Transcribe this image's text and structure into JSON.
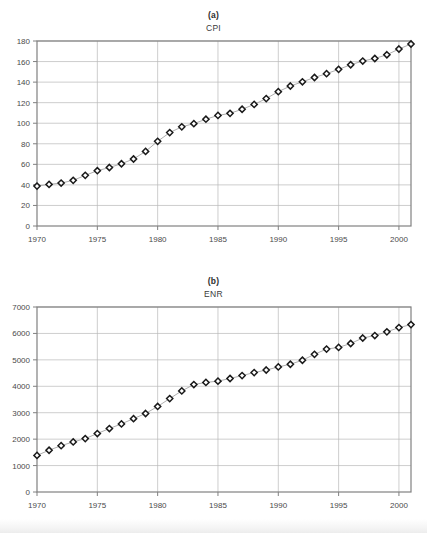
{
  "figure": {
    "panels": [
      {
        "letter": "(a)",
        "title": "CPI"
      },
      {
        "letter": "(b)",
        "title": "ENR"
      }
    ]
  },
  "colors": {
    "axis": "#808080",
    "gridline": "#b8b8b8",
    "marker_stroke": "#1a1a1a",
    "marker_fill": "#ffffff",
    "series_line": "#999999",
    "text": "#3a3a3a",
    "background": "#ffffff"
  },
  "chart_data": [
    {
      "type": "line",
      "title": "CPI",
      "panel_label": "(a)",
      "xlabel": "",
      "ylabel": "",
      "xlim": [
        1970,
        2001
      ],
      "ylim": [
        0,
        180
      ],
      "xticks": [
        1970,
        1975,
        1980,
        1985,
        1990,
        1995,
        2000
      ],
      "yticks": [
        0,
        20,
        40,
        60,
        80,
        100,
        120,
        140,
        160,
        180
      ],
      "xtick_labels": [
        "1970",
        "1975",
        "1980",
        "1985",
        "1990",
        "1995",
        "2000"
      ],
      "ytick_labels": [
        "0",
        "20",
        "40",
        "60",
        "80",
        "100",
        "120",
        "140",
        "160",
        "180"
      ],
      "grid": true,
      "legend": false,
      "marker": "open-diamond",
      "x": [
        1970,
        1971,
        1972,
        1973,
        1974,
        1975,
        1976,
        1977,
        1978,
        1979,
        1980,
        1981,
        1982,
        1983,
        1984,
        1985,
        1986,
        1987,
        1988,
        1989,
        1990,
        1991,
        1992,
        1993,
        1994,
        1995,
        1996,
        1997,
        1998,
        1999,
        2000,
        2001
      ],
      "values": [
        38.8,
        40.5,
        41.8,
        44.4,
        49.3,
        53.8,
        56.9,
        60.6,
        65.2,
        72.6,
        82.4,
        90.9,
        96.5,
        99.6,
        103.9,
        107.6,
        109.6,
        113.6,
        118.3,
        124.0,
        130.7,
        136.2,
        140.3,
        144.5,
        148.2,
        152.4,
        156.9,
        160.5,
        163.0,
        166.6,
        172.2,
        177.1
      ],
      "note": "Consumer Price Index, annual values 1970-2001"
    },
    {
      "type": "line",
      "title": "ENR",
      "panel_label": "(b)",
      "xlabel": "",
      "ylabel": "",
      "xlim": [
        1970,
        2001
      ],
      "ylim": [
        0,
        7000
      ],
      "xticks": [
        1970,
        1975,
        1980,
        1985,
        1990,
        1995,
        2000
      ],
      "yticks": [
        0,
        1000,
        2000,
        3000,
        4000,
        5000,
        6000,
        7000
      ],
      "xtick_labels": [
        "1970",
        "1975",
        "1980",
        "1985",
        "1990",
        "1995",
        "2000"
      ],
      "ytick_labels": [
        "0",
        "1000",
        "2000",
        "3000",
        "4000",
        "5000",
        "6000",
        "7000"
      ],
      "grid": true,
      "legend": false,
      "marker": "open-diamond",
      "x": [
        1970,
        1971,
        1972,
        1973,
        1974,
        1975,
        1976,
        1977,
        1978,
        1979,
        1980,
        1981,
        1982,
        1983,
        1984,
        1985,
        1986,
        1987,
        1988,
        1989,
        1990,
        1991,
        1992,
        1993,
        1994,
        1995,
        1996,
        1997,
        1998,
        1999,
        2000,
        2001
      ],
      "values": [
        1385,
        1581,
        1753,
        1895,
        2020,
        2212,
        2401,
        2576,
        2776,
        2970,
        3237,
        3535,
        3825,
        4066,
        4146,
        4195,
        4295,
        4406,
        4519,
        4615,
        4732,
        4835,
        4985,
        5210,
        5408,
        5471,
        5620,
        5826,
        5920,
        6059,
        6221,
        6334
      ],
      "note": "ENR construction cost index, annual values 1970-2001"
    }
  ]
}
